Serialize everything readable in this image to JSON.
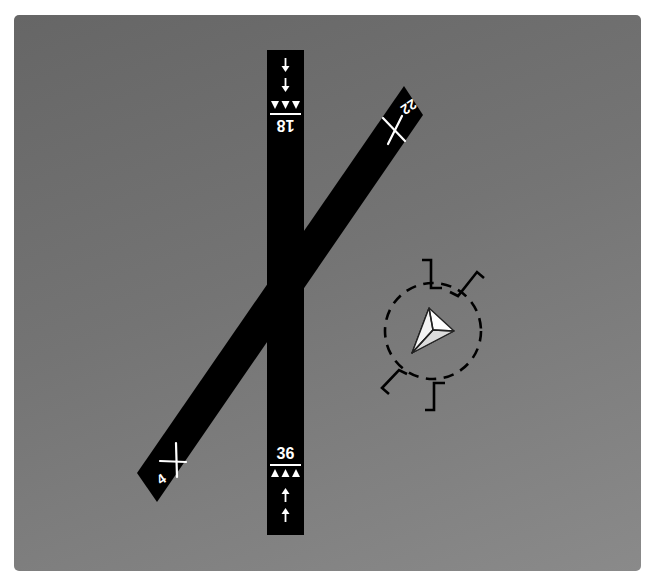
{
  "diagram": {
    "colors": {
      "background_top": "#666666",
      "background_bottom": "#8a8a8a",
      "runway": "#000000",
      "markings": "#ffffff",
      "segmented_circle": "#000000",
      "tetrahedron_fill": "#ffffff",
      "tetrahedron_shade": "#d8d8d8"
    },
    "runways": [
      {
        "id": "18-36",
        "orientation": "north-south",
        "ends": [
          {
            "label": "18",
            "position": "north",
            "markings": "displaced threshold arrows + threshold bar",
            "text_rotated": true
          },
          {
            "label": "36",
            "position": "south",
            "markings": "displaced threshold arrows + threshold bar",
            "text_rotated": false
          }
        ]
      },
      {
        "id": "4-22",
        "orientation": "northeast-southwest",
        "status": "closed",
        "closed_marker": "X",
        "ends": [
          {
            "label": "22",
            "position": "northeast"
          },
          {
            "label": "4",
            "position": "southwest"
          }
        ]
      }
    ],
    "wind_indicator": {
      "type": "segmented circle",
      "contents": "landing tetrahedron",
      "traffic_pattern_indicators": 4
    }
  }
}
